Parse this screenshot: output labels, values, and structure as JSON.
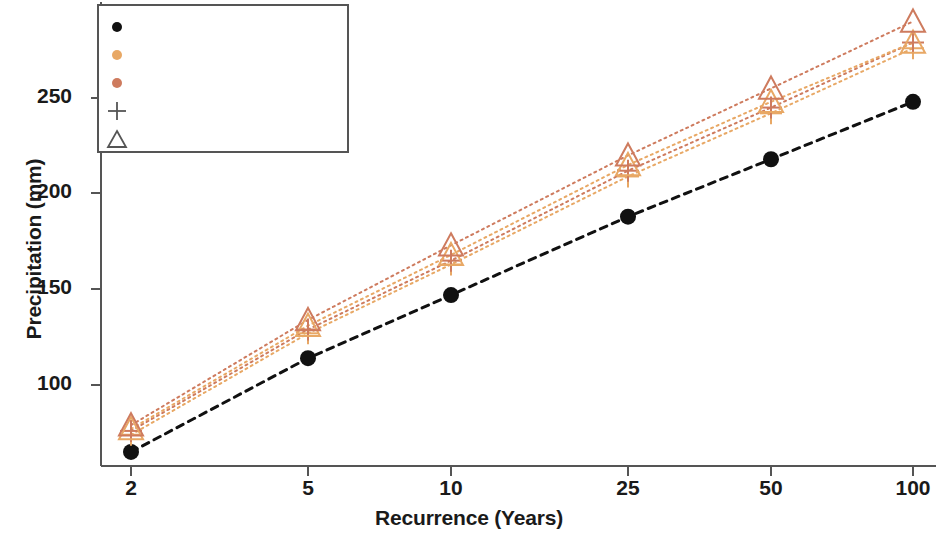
{
  "chart_data": {
    "type": "scatter",
    "title": "",
    "xlabel": "Recurrence (Years)",
    "ylabel": "Precipitation (mm)",
    "categories": [
      "2",
      "5",
      "10",
      "25",
      "50",
      "100"
    ],
    "x": [
      2,
      5,
      10,
      25,
      50,
      100
    ],
    "xtick_labels": [
      "2",
      "5",
      "10",
      "25",
      "50",
      "100"
    ],
    "ytick_labels": [
      "100",
      "150",
      "200",
      "250"
    ],
    "yticks": [
      100,
      150,
      200,
      250
    ],
    "xlim": [
      2,
      100
    ],
    "ylim": [
      58,
      293
    ],
    "xscale": "log",
    "grid": false,
    "legend_position": "upper left",
    "series": [
      {
        "name": "ERA5",
        "marker": "circle",
        "color": "#111111",
        "values": [
          65,
          114,
          147,
          188,
          218,
          248
        ]
      },
      {
        "name": "RCP45-2030",
        "marker": "plus",
        "color": "#E8A865",
        "values": [
          74,
          127,
          163,
          209,
          242,
          276
        ]
      },
      {
        "name": "RCP85-2030",
        "marker": "plus",
        "color": "#CE7B5E",
        "values": [
          76,
          129,
          165,
          212,
          245,
          279
        ]
      },
      {
        "name": "RCP45-2050",
        "marker": "triangle",
        "color": "#E8A865",
        "values": [
          77,
          131,
          168,
          215,
          248,
          279
        ]
      },
      {
        "name": "RCP85-2050",
        "marker": "triangle",
        "color": "#CE7B5E",
        "values": [
          79,
          134,
          173,
          220,
          255,
          290
        ]
      }
    ],
    "legend": [
      {
        "label": "ERA5",
        "marker": "circle",
        "color": "#111111"
      },
      {
        "label": "RCP45",
        "marker": "circle",
        "color": "#E8A865"
      },
      {
        "label": "RCP85",
        "marker": "circle",
        "color": "#CE7B5E"
      },
      {
        "label": "2030",
        "marker": "plus",
        "color": "#555555"
      },
      {
        "label": "2050",
        "marker": "triangle",
        "color": "#555555"
      }
    ]
  },
  "colors": {
    "era5": "#111111",
    "rcp45": "#E8A865",
    "rcp85": "#CE7B5E",
    "axis": "#555555",
    "text": "#1a1a1a"
  }
}
